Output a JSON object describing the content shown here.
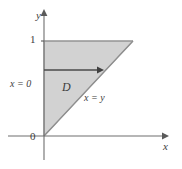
{
  "figure": {
    "type": "math-diagram",
    "background_color": "#ffffff",
    "axes": {
      "x_axis_label": "x",
      "y_axis_label": "y",
      "origin_label": "0",
      "axis_color": "#6e6e6e",
      "x_axis_y_px": 136,
      "y_axis_x_px": 44,
      "x_axis_start_px": 8,
      "x_axis_end_px": 168,
      "y_axis_start_px": 160,
      "y_axis_end_px": 10
    },
    "ticks": {
      "y": [
        {
          "label": "1",
          "value": 1,
          "y_px": 41
        }
      ]
    },
    "region": {
      "label": "D",
      "fill_color": "#d2d2d2",
      "edge_color": "#8c8c8c",
      "vertices_px": [
        {
          "x": 44,
          "y": 136
        },
        {
          "x": 44,
          "y": 41
        },
        {
          "x": 133,
          "y": 41
        }
      ],
      "vertices_math": [
        {
          "x": 0,
          "y": 0
        },
        {
          "x": 0,
          "y": 1
        },
        {
          "x": 1,
          "y": 1
        }
      ]
    },
    "boundary_labels": {
      "left_boundary": "x = 0",
      "diagonal_boundary": "x = y"
    },
    "direction_arrow": {
      "name": "horizontal-sweep-arrow",
      "color": "#4a4a4a",
      "from_px": {
        "x": 44,
        "y": 70
      },
      "to_px": {
        "x": 103,
        "y": 70
      }
    }
  }
}
